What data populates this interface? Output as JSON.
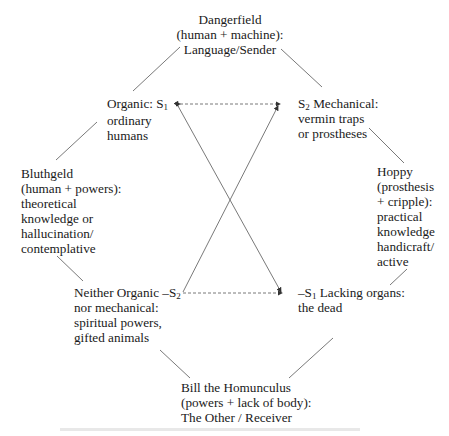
{
  "diagram": {
    "type": "semiotic-square",
    "nodes": {
      "top": {
        "lines": [
          "Dangerfield",
          "(human + machine):",
          "Language/Sender"
        ]
      },
      "s1": {
        "label_prefix": "Organic: S",
        "label_sub": "1",
        "lines": [
          "ordinary",
          "humans"
        ]
      },
      "s2": {
        "label_prefix": "S",
        "label_sub": "2",
        "label_suffix": " Mechanical:",
        "lines": [
          "vermin traps",
          "or prostheses"
        ]
      },
      "left": {
        "lines": [
          "Bluthgeld",
          "(human + powers):",
          "theoretical",
          "knowledge or",
          "hallucination/",
          "contemplative"
        ]
      },
      "right": {
        "lines": [
          "Hoppy",
          "(prosthesis",
          "+ cripple):",
          "practical",
          "knowledge",
          "handicraft/",
          "active"
        ]
      },
      "not_s2": {
        "label_prefix": "Neither Organic –S",
        "label_sub": "2",
        "lines": [
          "nor mechanical:",
          "spiritual powers,",
          "gifted animals"
        ]
      },
      "not_s1": {
        "label_prefix": "–S",
        "label_sub": "1",
        "label_suffix": " Lacking organs:",
        "lines": [
          "the dead"
        ]
      },
      "bottom": {
        "lines": [
          "Bill the Homunculus",
          "(powers + lack of body):",
          "The Other / Receiver"
        ]
      }
    },
    "edges": [
      {
        "from": "top",
        "to": "s1",
        "style": "solid"
      },
      {
        "from": "top",
        "to": "s2",
        "style": "solid"
      },
      {
        "from": "s1",
        "to": "left",
        "style": "solid"
      },
      {
        "from": "s2",
        "to": "right",
        "style": "solid"
      },
      {
        "from": "left",
        "to": "not_s2",
        "style": "solid"
      },
      {
        "from": "right",
        "to": "not_s1",
        "style": "solid"
      },
      {
        "from": "not_s2",
        "to": "bottom",
        "style": "solid"
      },
      {
        "from": "not_s1",
        "to": "bottom",
        "style": "solid"
      },
      {
        "from": "s1",
        "to": "s2",
        "style": "dashed",
        "arrows": "both"
      },
      {
        "from": "not_s2",
        "to": "not_s1",
        "style": "dashed",
        "arrows": "end"
      },
      {
        "from": "s1",
        "to": "not_s1",
        "style": "solid",
        "arrows": "both"
      },
      {
        "from": "not_s2",
        "to": "s2",
        "style": "solid",
        "arrows": "end"
      }
    ],
    "colors": {
      "line": "#6a6a6a",
      "text": "#1a1a1a"
    }
  }
}
